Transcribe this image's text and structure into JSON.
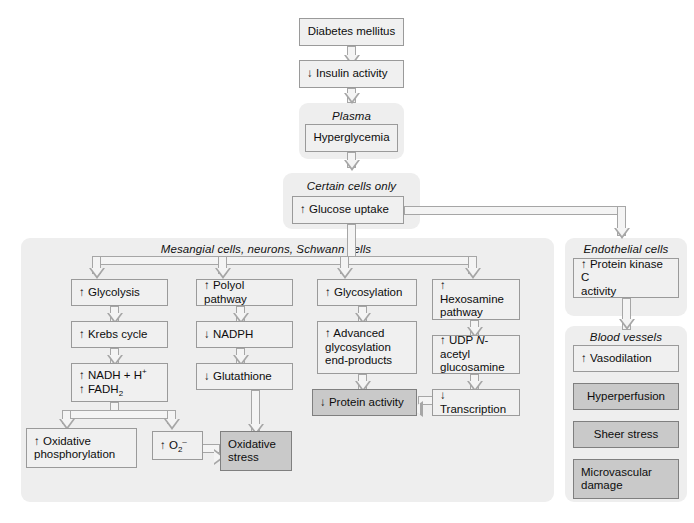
{
  "diagram": {
    "arrow_up": "↑",
    "arrow_down": "↓"
  },
  "groups": {
    "plasma": "Plasma",
    "certain_cells": "Certain cells only",
    "mesangial": "Mesangial cells, neurons, Schwann cells",
    "endothelial": "Endothelial cells",
    "blood_vessels": "Blood vessels"
  },
  "nodes": {
    "diabetes": "Diabetes mellitus",
    "insulin": "↓ Insulin activity",
    "hyperglycemia": "Hyperglycemia",
    "glucose_uptake": "↑ Glucose uptake",
    "glycolysis": "↑ Glycolysis",
    "krebs": "↑ Krebs cycle",
    "nadh_line1": "↑ NADH + H",
    "nadh_sup": "+",
    "fadh_line2": "↑ FADH",
    "fadh_sub": "2",
    "oxphos": "↑ Oxidative\nphosphorylation",
    "polyol": "↑ Polyol pathway",
    "nadph": "↓ NADPH",
    "glutathione": "↓ Glutathione",
    "superoxide_pre": "↑ O",
    "superoxide_sub": "2",
    "superoxide_sup": "–",
    "oxidative_stress": "Oxidative\nstress",
    "glycosylation": "↑ Glycosylation",
    "age": "↑ Advanced\nglycosylation\nend-products",
    "protein_activity": "↓ Protein activity",
    "hexosamine": "↑ Hexosamine\npathway",
    "udp_pre": "↑ UDP ",
    "udp_ital": "N",
    "udp_post": "-acetyl\nglucosamine",
    "transcription": "↓ Transcription",
    "pkc": "↑ Protein kinase C\nactivity",
    "vasodilation": "↑ Vasodilation",
    "hyperperfusion": "Hyperperfusion",
    "sheer_stress": "Sheer stress",
    "microvascular": "Microvascular\ndamage"
  },
  "colors": {
    "panel_bg": "#eeeeee",
    "node_bg": "#f0f0f0",
    "node_shaded_bg": "#c9c9c9",
    "node_border": "#9a9a9a",
    "connector": "#a6a6a6",
    "page_bg": "#ffffff",
    "text": "#0d0d0d"
  }
}
